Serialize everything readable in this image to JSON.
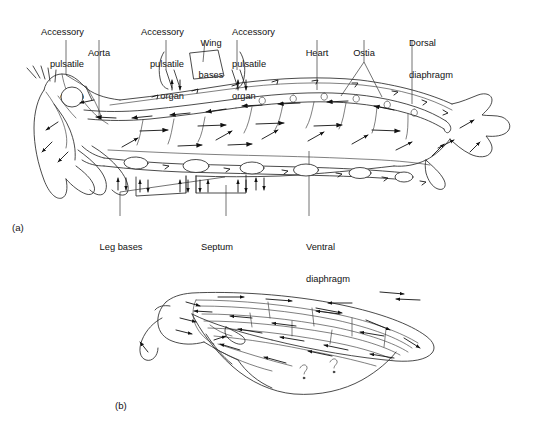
{
  "figure": {
    "title_present": false,
    "background_color": "#ffffff",
    "ink_color": "#2b2b2b",
    "panels": [
      {
        "id": "a",
        "id_label": "(a)",
        "subject": "insect-body-longitudinal-section-hemolymph-circulation"
      },
      {
        "id": "b",
        "id_label": "(b)",
        "subject": "insect-wing-venation-hemolymph-circulation"
      }
    ]
  },
  "panel_a": {
    "id_label": "(a)",
    "labels_top": [
      {
        "key": "accessory_pulsatile_organ_1",
        "text": "Accessory\npulsatile\norgan",
        "lines": [
          "Accessory",
          "pulsatile",
          "organ"
        ],
        "align": "right"
      },
      {
        "key": "aorta",
        "text": "Aorta",
        "lines": [
          "Aorta"
        ],
        "align": "center"
      },
      {
        "key": "accessory_pulsatile_organ_2",
        "text": "Accessory\npulsatile\norgan",
        "lines": [
          "Accessory",
          "pulsatile",
          "organ"
        ],
        "align": "right"
      },
      {
        "key": "wing_bases",
        "text": "Wing\nbases",
        "lines": [
          "Wing",
          "bases"
        ],
        "align": "center"
      },
      {
        "key": "accessory_pulsatile_organ_3",
        "text": "Accessory\npulsatile\norgan",
        "lines": [
          "Accessory",
          "pulsatile",
          "organ"
        ],
        "align": "left"
      },
      {
        "key": "heart",
        "text": "Heart",
        "lines": [
          "Heart"
        ],
        "align": "center"
      },
      {
        "key": "ostia",
        "text": "Ostia",
        "lines": [
          "Ostia"
        ],
        "align": "center"
      },
      {
        "key": "dorsal_diaphragm",
        "text": "Dorsal\ndiaphragm",
        "lines": [
          "Dorsal",
          "diaphragm"
        ],
        "align": "left"
      }
    ],
    "labels_bottom": [
      {
        "key": "leg_bases",
        "text": "Leg bases",
        "lines": [
          "Leg bases"
        ],
        "align": "center"
      },
      {
        "key": "septum",
        "text": "Septum",
        "lines": [
          "Septum"
        ],
        "align": "center"
      },
      {
        "key": "ventral_diaphragm",
        "text": "Ventral\ndiaphragm",
        "lines": [
          "Ventral",
          "diaphragm"
        ],
        "align": "left"
      }
    ]
  },
  "panel_b": {
    "id_label": "(b)"
  },
  "label_text": {
    "accessory": "Accessory",
    "pulsatile": "pulsatile",
    "organ": "organ",
    "aorta": "Aorta",
    "wing": "Wing",
    "bases": "bases",
    "heart": "Heart",
    "ostia": "Ostia",
    "dorsal": "Dorsal",
    "diaphragm": "diaphragm",
    "leg_bases": "Leg bases",
    "septum": "Septum",
    "ventral": "Ventral",
    "panel_a_id": "(a)",
    "panel_b_id": "(b)"
  }
}
